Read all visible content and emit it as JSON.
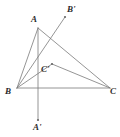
{
  "figure": {
    "type": "geometry-diagram",
    "width": 120,
    "height": 137,
    "background_color": "#ffffff",
    "line_color": "#7a7a7a",
    "point_color": "#6b6b6b",
    "label_color": "#2b2b2b"
  },
  "points": {
    "A": {
      "label": "A",
      "x": 38,
      "y": 28,
      "label_x": 31,
      "label_y": 15,
      "marker": false
    },
    "B": {
      "label": "B",
      "x": 17,
      "y": 88,
      "label_x": 5,
      "label_y": 87,
      "marker": false
    },
    "C": {
      "label": "C",
      "x": 110,
      "y": 88,
      "label_x": 110,
      "label_y": 87,
      "marker": false
    },
    "Aprime": {
      "label": "A'",
      "x": 38,
      "y": 120,
      "label_x": 33,
      "label_y": 123,
      "marker": true
    },
    "Bprime": {
      "label": "B'",
      "x": 65,
      "y": 17,
      "label_x": 67,
      "label_y": 5,
      "marker": true
    },
    "Cprime": {
      "label": "C'",
      "x": 52,
      "y": 64,
      "label_x": 41,
      "label_y": 65,
      "marker": true
    }
  },
  "segments": [
    {
      "name": "side-AB",
      "from": "A",
      "to": "B"
    },
    {
      "name": "side-BC",
      "from": "B",
      "to": "C"
    },
    {
      "name": "side-AC",
      "from": "A",
      "to": "C"
    },
    {
      "name": "altitude-A-to-Aprime",
      "from": "A",
      "to": "Aprime"
    },
    {
      "name": "ray-B-to-Bprime",
      "from": "B",
      "to": "Bprime"
    },
    {
      "name": "segment-B-to-Cprime",
      "from": "B",
      "to": "Cprime"
    },
    {
      "name": "segment-Cprime-to-C",
      "from": "Cprime",
      "to": "C"
    }
  ]
}
